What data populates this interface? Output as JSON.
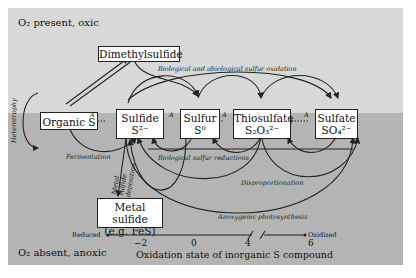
{
  "zones": {
    "oxic_label": "O₂ present, oxic",
    "anoxic_label": "O₂ absent, anoxic",
    "colors": {
      "oxic_bg": "#d8d8d8",
      "anoxic_bg": "#b4b4b4",
      "box_bg": "#ffffff",
      "line": "#222222"
    }
  },
  "nodes": {
    "dms": {
      "label": "Dimethylsulfide"
    },
    "organic_s": {
      "label": "Organic S"
    },
    "sulfide": {
      "label": "Sulfide",
      "formula": "S²⁻"
    },
    "sulfur": {
      "label": "Sulfur",
      "formula": "S⁰"
    },
    "thiosulfate": {
      "label": "Thiosulfate",
      "formula": "S₂O₃²⁻"
    },
    "sulfate": {
      "label": "Sulfate",
      "formula": "SO₄²⁻"
    },
    "metal_sulfide": {
      "label": "Metal sulfide",
      "sublabel": "(e.g. FeS)"
    }
  },
  "processes": {
    "oxidation": "Biological and abiological sulfur oxidation",
    "heterotrophy": "Heterotrophy",
    "fermentation": "Fermentation",
    "deposition": "Metal sulfide deposition",
    "reductions": "Biological sulfur reductions",
    "disproportionation": "Disproportionation",
    "photosynthesis": "Anoxygenic photosynthesis",
    "assimilation_marker": "A"
  },
  "axis": {
    "left_label": "Reduced",
    "right_label": "Oxidized",
    "ticks": [
      "−2",
      "0",
      "4",
      "6"
    ],
    "title": "Oxidation state of inorganic S compound"
  }
}
